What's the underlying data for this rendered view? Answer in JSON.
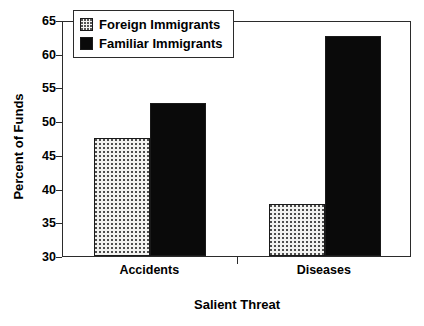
{
  "chart_data": {
    "type": "bar",
    "title": "",
    "xlabel": "Salient Threat",
    "ylabel": "Percent of Funds",
    "categories": [
      "Accidents",
      "Diseases"
    ],
    "series": [
      {
        "name": "Foreign Immigrants",
        "values": [
          47.5,
          37.7
        ],
        "color": "#f2f2f0",
        "pattern": "fine-dotted"
      },
      {
        "name": "Familiar Immigrants",
        "values": [
          52.7,
          62.6
        ],
        "color": "#0a0a0a",
        "pattern": "solid"
      }
    ],
    "ylim": [
      30,
      65
    ],
    "yticks": [
      30,
      35,
      40,
      45,
      50,
      55,
      60,
      65
    ],
    "ytick_labels": [
      "30",
      "35",
      "40",
      "45",
      "50",
      "55",
      "60",
      "65"
    ],
    "grid": false,
    "legend_position": "top-left-inside",
    "axis_color": "#2b2b2b"
  },
  "legend": {
    "entries": [
      {
        "label": "Foreign Immigrants"
      },
      {
        "label": "Familiar Immigrants"
      }
    ]
  }
}
